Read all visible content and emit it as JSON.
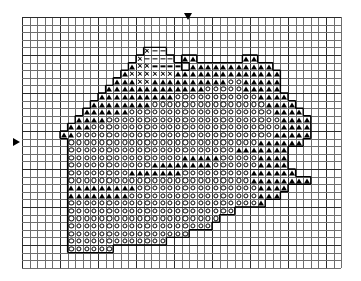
{
  "chart_data": {
    "type": "table",
    "grid": {
      "columns": 42,
      "rows": 33,
      "cell_size_px": 7.6,
      "origin_x_px": 22,
      "origin_y_px": 17,
      "minor_line_color": "#6e6e6e",
      "major_line_color": "#2b2b2b",
      "major_every": 5,
      "grid": true
    },
    "legend": [
      {
        "symbol": "triangle",
        "glyph": "▲",
        "name": "filled-triangle"
      },
      {
        "symbol": "circle",
        "glyph": "○",
        "name": "open-circle"
      },
      {
        "symbol": "dash",
        "glyph": "−",
        "name": "dash"
      },
      {
        "symbol": "cross",
        "glyph": "×",
        "name": "cross"
      }
    ],
    "markers": [
      {
        "name": "center-column-marker",
        "direction": "down",
        "x_px": 184,
        "y_px": 13
      },
      {
        "name": "center-row-marker",
        "direction": "right",
        "x_px": 13,
        "y_px": 138
      }
    ],
    "symbol_key": {
      ".": "empty",
      "T": "triangle",
      "O": "circle",
      "-": "dash",
      "X": "cross"
    },
    "rows": [
      "..........................................",
      "..........................................",
      "..........................................",
      "..........................................",
      "................X--.......................",
      "...............X----.TT......TT...........",
      "..............TXX----.TTTTTTTTTTT.........",
      ".............TXXXXXXTTTTTTTTTTTTTT........",
      "............TTTXXTTTTTTTTTTOOTTTTT........",
      "...........TTTTTTTTTTTTTOOOOOTTTTT........",
      "..........TTTTTTTTTTOOOOOOOOOOOTTTT.......",
      ".........TTTTTTTTOOOOOOOOOOOOOOOTTTT......",
      "........TTTTTTOOOOOOOOOOOOOOOOOOOTTTT.....",
      ".......TTTTOOOOOOOOOOOOOOOOOOOOOOOTTTT....",
      "......TTTOOOOOOOOOOOOOOOOOOOOOOOOOTTTT...",
      ".....TTOOOOOOOOOOOOOOOOOOOOOOOOOOTTTTT...",
      "......OOOOOOOOOOOOOOOOOOOOOOOOOTTTTTT....",
      "......OOOOOOOOOOOOOOOOOOOOOOTTTTTTT......",
      "......OOOOOOOOOOOOOOOTTTTTOOOOOTTTT......",
      "......OOOOOOOOOOOTTTTTTTTOOOOOOTTTT......",
      "......OOOOOOOOTTTTTTTOOOOOOOOOTTTTTT.....",
      "......OOOOOOOOOOOOOOOOOOOOOOOOTTTTTTTT...",
      "......TTTTTTTTTOOOOOOOOOOOOOOOOTTTT......",
      "......TTTTTTTTOOOOOOOOOOOOOOOOOTTT.......",
      "......OOOOOOOOOOOOOOOOOOOOOOOOOT.........",
      "......OOOOOOOOOOOOOOOOOOOOOO.............",
      "......OOOOOOOOOOOOOOOOOOOO...............",
      "......OOOOOOOOOOOOOOOOOOO................",
      "......OOOOOOOOOOOOOOOO...................",
      "......OOOOOOOOOOOOO......................",
      "......OOOOOO.............................",
      "..........................................",
      ".........................................."
    ]
  }
}
